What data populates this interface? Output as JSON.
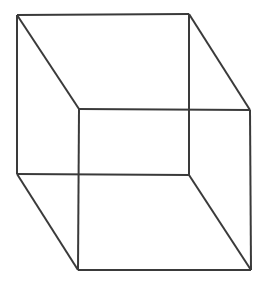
{
  "figure": {
    "name": "Necker cube",
    "type": "wireframe-line-drawing",
    "canvas": {
      "width": 267,
      "height": 286,
      "background_color": "#ffffff"
    },
    "style": {
      "stroke_color": "#3a3a3a",
      "stroke_width": 2,
      "fill": "none"
    },
    "geometry": {
      "back_face_label": "back-square",
      "front_face_label": "front-square",
      "vertices": {
        "back_top_left": {
          "x": 17,
          "y": 15
        },
        "back_top_right": {
          "x": 189,
          "y": 14
        },
        "back_bottom_right": {
          "x": 189,
          "y": 175
        },
        "back_bottom_left": {
          "x": 17,
          "y": 174
        },
        "front_top_left": {
          "x": 79,
          "y": 109
        },
        "front_top_right": {
          "x": 250,
          "y": 110
        },
        "front_bottom_right": {
          "x": 251,
          "y": 270
        },
        "front_bottom_left": {
          "x": 78,
          "y": 270
        }
      },
      "edges": [
        {
          "name": "back-top",
          "from": "back_top_left",
          "to": "back_top_right"
        },
        {
          "name": "back-right",
          "from": "back_top_right",
          "to": "back_bottom_right"
        },
        {
          "name": "back-bottom",
          "from": "back_bottom_right",
          "to": "back_bottom_left"
        },
        {
          "name": "back-left",
          "from": "back_bottom_left",
          "to": "back_top_left"
        },
        {
          "name": "front-top",
          "from": "front_top_left",
          "to": "front_top_right"
        },
        {
          "name": "front-right",
          "from": "front_top_right",
          "to": "front_bottom_right"
        },
        {
          "name": "front-bottom",
          "from": "front_bottom_right",
          "to": "front_bottom_left"
        },
        {
          "name": "front-left",
          "from": "front_bottom_left",
          "to": "front_top_left"
        },
        {
          "name": "connector-top-left",
          "from": "back_top_left",
          "to": "front_top_left"
        },
        {
          "name": "connector-top-right",
          "from": "back_top_right",
          "to": "front_top_right"
        },
        {
          "name": "connector-bottom-right",
          "from": "back_bottom_right",
          "to": "front_bottom_right"
        },
        {
          "name": "connector-bottom-left",
          "from": "back_bottom_left",
          "to": "front_bottom_left"
        }
      ],
      "line_crossings": [
        {
          "name": "crossing-upper-right",
          "x": 189,
          "y": 108
        },
        {
          "name": "crossing-lower-left",
          "x": 79,
          "y": 174
        }
      ]
    }
  }
}
